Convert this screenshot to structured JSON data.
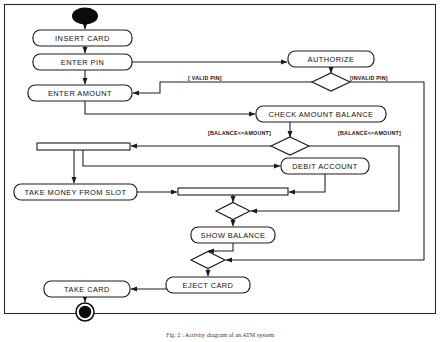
{
  "diagram": {
    "caption": "Fig. 2 : Activity diagram of an ATM system",
    "canvas": {
      "width": 440,
      "height": 342
    },
    "colors": {
      "stroke": "#1c1c1c",
      "fill": "#ffffff",
      "node": "#0b0b0b",
      "text": "#111111"
    },
    "start_node": {
      "name": "start-node",
      "cx": 85,
      "cy": 16,
      "rx": 13,
      "ry": 8.5
    },
    "end_node": {
      "name": "end-node",
      "cx": 85,
      "cy": 312,
      "r_outer": 9,
      "r_inner": 6
    },
    "activities": [
      {
        "id": "insert-card",
        "label": "INSERT CARD",
        "x": 33,
        "y": 30,
        "w": 99,
        "h": 16
      },
      {
        "id": "enter-pin",
        "label": "ENTER PIN",
        "x": 33,
        "y": 54,
        "w": 99,
        "h": 16
      },
      {
        "id": "enter-amount",
        "label": "ENTER AMOUNT",
        "x": 28,
        "y": 85,
        "w": 104,
        "h": 16
      },
      {
        "id": "authorize",
        "label": "AUTHORIZE",
        "x": 288,
        "y": 51,
        "w": 86,
        "h": 16
      },
      {
        "id": "check-balance",
        "label": "CHECK AMOUNT BALANCE",
        "x": 256,
        "y": 106,
        "w": 130,
        "h": 16
      },
      {
        "id": "debit-account",
        "label": "DEBIT ACCOUNT",
        "x": 281,
        "y": 158,
        "w": 88,
        "h": 16
      },
      {
        "id": "take-money",
        "label": "TAKE MONEY FROM SLOT",
        "x": 14,
        "y": 184,
        "w": 123,
        "h": 16
      },
      {
        "id": "show-balance",
        "label": "SHOW BALANCE",
        "x": 191,
        "y": 227,
        "w": 84,
        "h": 16
      },
      {
        "id": "eject-card",
        "label": "EJECT CARD",
        "x": 166,
        "y": 277,
        "w": 84,
        "h": 16
      },
      {
        "id": "take-card",
        "label": "TAKE CARD",
        "x": 44,
        "y": 281,
        "w": 86,
        "h": 16
      }
    ],
    "decisions": [
      {
        "id": "decision-pin",
        "cx": 331,
        "cy": 82,
        "rx": 19,
        "ry": 9
      },
      {
        "id": "decision-balance",
        "cx": 290,
        "cy": 146,
        "rx": 19,
        "ry": 9
      },
      {
        "id": "decision-merge-1",
        "cx": 233,
        "cy": 211,
        "rx": 17,
        "ry": 8.5
      },
      {
        "id": "decision-merge-2",
        "cx": 208,
        "cy": 260,
        "rx": 17,
        "ry": 8.5
      }
    ],
    "bars": [
      {
        "id": "merge-bar-upper",
        "x": 37,
        "y": 143,
        "w": 93,
        "h": 7
      },
      {
        "id": "merge-bar-lower",
        "x": 178,
        "y": 188,
        "w": 110,
        "h": 7
      }
    ],
    "guards": [
      {
        "id": "guard-valid-pin",
        "label": "[ VALID PIN]",
        "x": 188,
        "y": 79
      },
      {
        "id": "guard-invalid-pin",
        "label": "[INVALID PIN]",
        "x": 350,
        "y": 79
      },
      {
        "id": "guard-balance-ge",
        "label": "[BALANCE<=AMOUNT]",
        "x": 208,
        "y": 134
      },
      {
        "id": "guard-balance-lt",
        "label": "[BALANCE<=AMOUNT]",
        "x": 338,
        "y": 134
      }
    ]
  }
}
